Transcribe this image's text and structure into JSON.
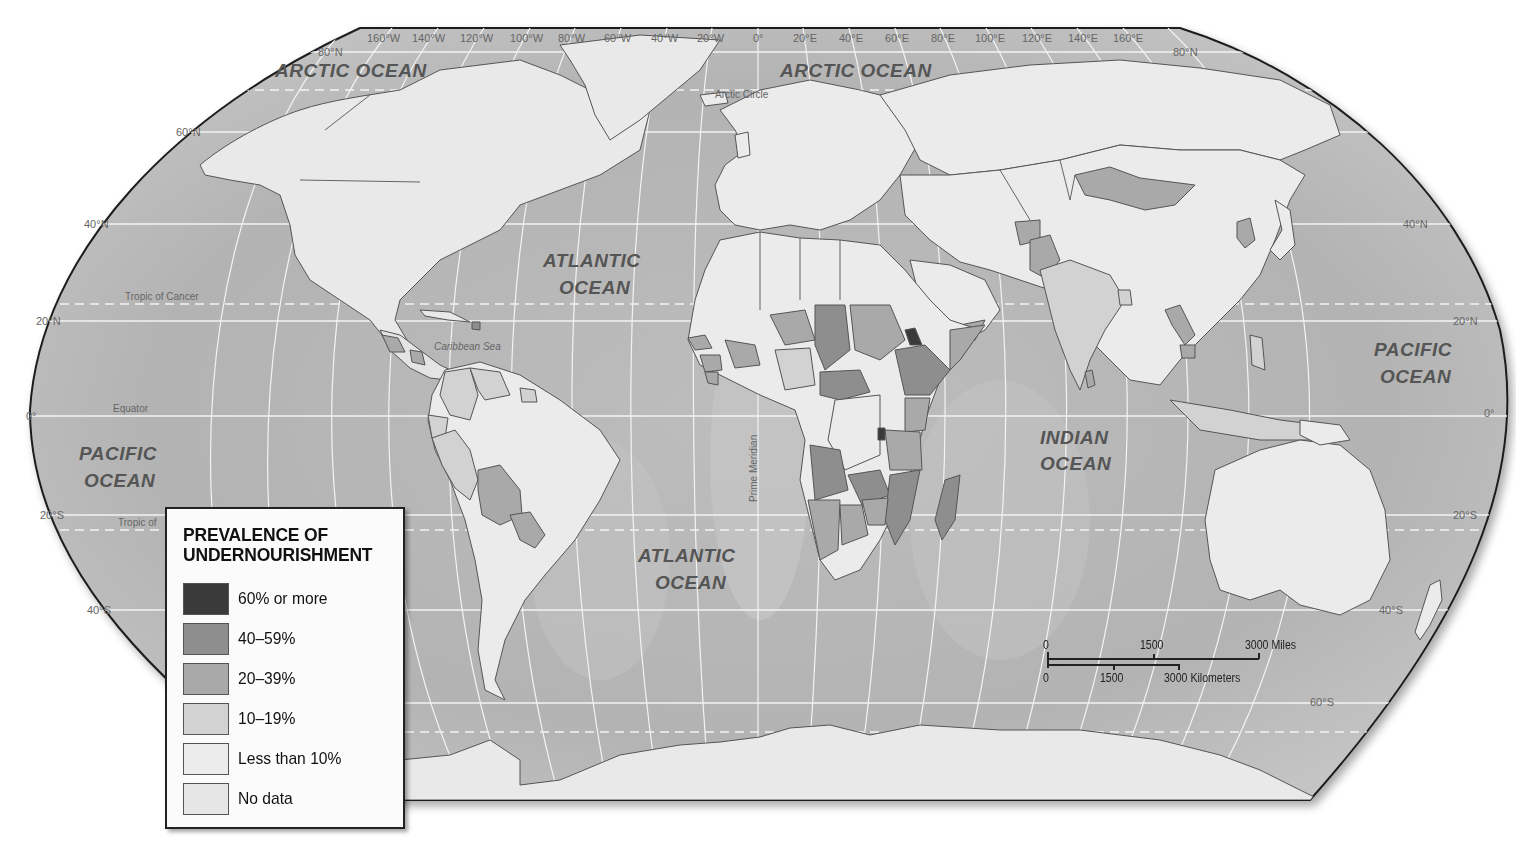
{
  "map": {
    "type": "choropleth world map",
    "projection": "Robinson",
    "theme": "Prevalence of undernourishment",
    "colors": {
      "background": "#ffffff",
      "ocean": "#b9b9b9",
      "ocean_shelf": "#d2d2d2",
      "graticule": "#f4f4f4",
      "frame": "#1e1e1e",
      "country_border": "#555555",
      "ocean_label": "#555555",
      "coord_label": "#666666"
    },
    "ocean_labels": [
      {
        "id": "arctic-ocean-west",
        "text": "ARCTIC OCEAN"
      },
      {
        "id": "arctic-ocean-east",
        "text": "ARCTIC OCEAN"
      },
      {
        "id": "atlantic-north-1",
        "text": "ATLANTIC"
      },
      {
        "id": "atlantic-north-2",
        "text": "OCEAN"
      },
      {
        "id": "atlantic-south-1",
        "text": "ATLANTIC"
      },
      {
        "id": "atlantic-south-2",
        "text": "OCEAN"
      },
      {
        "id": "pacific-west-1",
        "text": "PACIFIC"
      },
      {
        "id": "pacific-west-2",
        "text": "OCEAN"
      },
      {
        "id": "pacific-east-1",
        "text": "PACIFIC"
      },
      {
        "id": "pacific-east-2",
        "text": "OCEAN"
      },
      {
        "id": "indian-1",
        "text": "INDIAN"
      },
      {
        "id": "indian-2",
        "text": "OCEAN"
      }
    ],
    "feature_labels": {
      "arctic_circle": "Arctic Circle",
      "tropic_of_cancer": "Tropic of Cancer",
      "tropic_of_capricorn": "Tropic of",
      "equator": "Equator",
      "prime_meridian": "Prime Meridian",
      "caribbean_sea": "Caribbean Sea"
    },
    "longitude_labels": [
      "160°W",
      "140°W",
      "120°W",
      "100°W",
      "80°W",
      "60°W",
      "40°W",
      "20°W",
      "0°",
      "20°E",
      "40°E",
      "60°E",
      "80°E",
      "100°E",
      "120°E",
      "140°E",
      "160°E"
    ],
    "latitude_labels_left": [
      "80°N",
      "60°N",
      "40°N",
      "20°N",
      "0°",
      "20°S",
      "40°S"
    ],
    "latitude_labels_right": [
      "80°N",
      "40°N",
      "20°N",
      "0°",
      "20°S",
      "40°S",
      "60°S"
    ]
  },
  "legend": {
    "title_line1": "PREVALENCE OF",
    "title_line2": "UNDERNOURISHMENT",
    "items": [
      {
        "label": "60% or more",
        "color": "#3a3a3a"
      },
      {
        "label": "40–59%",
        "color": "#8e8e8e"
      },
      {
        "label": "20–39%",
        "color": "#a9a9a9"
      },
      {
        "label": "10–19%",
        "color": "#d2d2d2"
      },
      {
        "label": "Less than 10%",
        "color": "#ececec"
      },
      {
        "label": "No data",
        "color": "#e6e6e6"
      }
    ]
  },
  "scale_bar": {
    "miles_ticks": [
      "0",
      "1500",
      "3000 Miles"
    ],
    "km_ticks": [
      "0",
      "1500",
      "3000 Kilometers"
    ]
  },
  "regions_by_category": {
    "60% or more": [
      "Eritrea",
      "Burundi"
    ],
    "40-59%": [
      "Chad",
      "Central African Republic",
      "Ethiopia",
      "Zambia",
      "Angola",
      "Mozambique",
      "Madagascar",
      "Haiti"
    ],
    "20-39%": [
      "Sudan",
      "Kenya",
      "Tanzania",
      "Niger",
      "Mali",
      "Namibia",
      "Botswana",
      "Zimbabwe",
      "Sierra Leone",
      "Liberia",
      "Guinea",
      "Senegal",
      "Yemen",
      "Somalia",
      "Mongolia",
      "North Korea",
      "Laos",
      "Cambodia",
      "Bolivia",
      "Paraguay",
      "Guatemala",
      "Nicaragua",
      "Pakistan",
      "Afghanistan",
      "Sri Lanka"
    ],
    "10-19%": [
      "India",
      "Bangladesh",
      "Nepal",
      "Peru",
      "Colombia",
      "Ecuador",
      "Venezuela",
      "Guyana",
      "Nigeria",
      "Cameroon",
      "Gabon",
      "Congo",
      "Thailand",
      "Vietnam",
      "Philippines",
      "Indonesia",
      "Mexico"
    ],
    "Less than 10%": [
      "United States",
      "Canada",
      "Europe",
      "Russia",
      "China",
      "Brazil",
      "Argentina",
      "Chile",
      "Australia",
      "Egypt",
      "Libya",
      "Algeria",
      "Morocco",
      "South Africa",
      "Dem. Rep. Congo"
    ]
  }
}
